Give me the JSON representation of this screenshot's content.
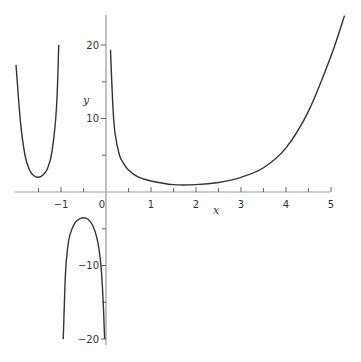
{
  "chart_data": {
    "type": "line",
    "title": "",
    "xlabel": "x",
    "ylabel": "y",
    "xlim": [
      -2.0,
      5.3
    ],
    "ylim": [
      -20.5,
      24
    ],
    "grid": false,
    "legend": null,
    "x_ticks": [
      -1,
      0,
      1,
      2,
      3,
      4,
      5
    ],
    "x_tick_labels": [
      "−1",
      "0",
      "1",
      "2",
      "3",
      "4",
      "5"
    ],
    "x_minor_ticks": [
      -1.5,
      -0.5,
      0.5,
      1.5,
      2.5,
      3.5,
      4.5
    ],
    "y_ticks": [
      20,
      10,
      -10,
      -20
    ],
    "y_tick_labels": [
      "20",
      "10",
      "−10",
      "−20"
    ],
    "y_minor_ticks": [
      15,
      5,
      -5,
      -15
    ],
    "vertical_asymptotes": [
      -1,
      0
    ],
    "series": [
      {
        "name": "branch-left-of-minus-1",
        "x": [
          -2.0,
          -1.9,
          -1.8,
          -1.7,
          -1.6,
          -1.5,
          -1.4,
          -1.3,
          -1.2,
          -1.1,
          -1.05
        ],
        "y": [
          17.3,
          9.5,
          5.0,
          3.0,
          2.2,
          2.0,
          2.3,
          3.2,
          5.5,
          11.5,
          20.0
        ]
      },
      {
        "name": "branch-between-minus-1-and-0",
        "x": [
          -0.95,
          -0.9,
          -0.85,
          -0.8,
          -0.7,
          -0.6,
          -0.5,
          -0.4,
          -0.3,
          -0.2,
          -0.12,
          -0.07,
          -0.03
        ],
        "y": [
          -20.0,
          -11.0,
          -7.5,
          -5.8,
          -4.3,
          -3.7,
          -3.5,
          -3.7,
          -4.5,
          -6.3,
          -9.5,
          -14.0,
          -20.0
        ]
      },
      {
        "name": "branch-right-of-0",
        "x": [
          0.1,
          0.15,
          0.2,
          0.3,
          0.4,
          0.5,
          0.7,
          1.0,
          1.5,
          2.0,
          2.5,
          3.0,
          3.5,
          4.0,
          4.5,
          5.0,
          5.3
        ],
        "y": [
          19.3,
          12.0,
          8.0,
          5.0,
          3.8,
          3.0,
          2.1,
          1.5,
          1.0,
          1.0,
          1.3,
          2.0,
          3.3,
          6.0,
          11.0,
          18.5,
          24.0
        ]
      }
    ]
  }
}
